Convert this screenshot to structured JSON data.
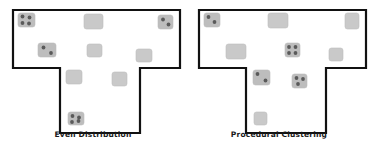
{
  "figure": {
    "background_color": "#ffffff",
    "outline_color": "#111111",
    "outline_width": 2.2,
    "room_fill_empty": "#c9c9c9",
    "room_fill_occupied": "#bdbdbd",
    "room_stroke": "#bdbdbd",
    "dot_color": "#5a5a5a",
    "dot_radius": 1.9,
    "room_corner_radius": 2.5
  },
  "panels": [
    {
      "id": "even-distribution",
      "caption": "Even Distribution",
      "outline_points": "13,10 180,10 180,68 140,68 140,133 60,133 60,68 13,68",
      "rooms": [
        {
          "name": "room-top-left",
          "x": 18,
          "y": 13,
          "w": 17,
          "h": 14,
          "occupied": true,
          "dots": [
            [
              22.5,
              16.5
            ],
            [
              29.5,
              17.5
            ],
            [
              22.5,
              23.0
            ],
            [
              29.0,
              23.5
            ]
          ]
        },
        {
          "name": "room-top-center",
          "x": 84,
          "y": 14,
          "w": 19,
          "h": 15,
          "occupied": false,
          "dots": []
        },
        {
          "name": "room-top-right",
          "x": 158,
          "y": 15,
          "w": 15,
          "h": 14,
          "occupied": true,
          "dots": [
            [
              163.0,
              19.5
            ],
            [
              168.5,
              24.5
            ]
          ]
        },
        {
          "name": "room-mid-left",
          "x": 38,
          "y": 43,
          "w": 18,
          "h": 14,
          "occupied": true,
          "dots": [
            [
              43.5,
              47.5
            ],
            [
              51.0,
              53.0
            ]
          ]
        },
        {
          "name": "room-mid-center",
          "x": 87,
          "y": 44,
          "w": 15,
          "h": 13,
          "occupied": false,
          "dots": []
        },
        {
          "name": "room-mid-right",
          "x": 136,
          "y": 49,
          "w": 16,
          "h": 13,
          "occupied": false,
          "dots": []
        },
        {
          "name": "room-stem-left",
          "x": 66,
          "y": 70,
          "w": 16,
          "h": 14,
          "occupied": false,
          "dots": []
        },
        {
          "name": "room-stem-right",
          "x": 112,
          "y": 72,
          "w": 15,
          "h": 14,
          "occupied": false,
          "dots": []
        },
        {
          "name": "room-stem-bottom",
          "x": 68,
          "y": 112,
          "w": 16,
          "h": 13,
          "occupied": true,
          "dots": [
            [
              72.5,
              116.0
            ],
            [
              79.0,
              117.5
            ],
            [
              72.0,
              122.0
            ],
            [
              78.5,
              121.0
            ]
          ]
        }
      ]
    },
    {
      "id": "procedural-clustering",
      "caption": "Procedural Clustering",
      "outline_points": "13,10 180,10 180,68 140,68 140,133 60,133 60,68 13,68",
      "rooms": [
        {
          "name": "room-top-left",
          "x": 18,
          "y": 13,
          "w": 16,
          "h": 14,
          "occupied": true,
          "dots": [
            [
              22.5,
              17.0
            ],
            [
              28.5,
              22.0
            ]
          ]
        },
        {
          "name": "room-top-center",
          "x": 82,
          "y": 13,
          "w": 20,
          "h": 15,
          "occupied": false,
          "dots": []
        },
        {
          "name": "room-top-right",
          "x": 159,
          "y": 13,
          "w": 14,
          "h": 16,
          "occupied": false,
          "dots": []
        },
        {
          "name": "room-mid-left",
          "x": 40,
          "y": 44,
          "w": 20,
          "h": 15,
          "occupied": false,
          "dots": []
        },
        {
          "name": "room-mid-center",
          "x": 99,
          "y": 43,
          "w": 15,
          "h": 14,
          "occupied": true,
          "dots": [
            [
              103.0,
              47.0
            ],
            [
              109.5,
              47.0
            ],
            [
              103.0,
              53.0
            ],
            [
              109.5,
              53.0
            ]
          ]
        },
        {
          "name": "room-mid-right",
          "x": 143,
          "y": 48,
          "w": 14,
          "h": 13,
          "occupied": false,
          "dots": []
        },
        {
          "name": "room-stem-left",
          "x": 67,
          "y": 70,
          "w": 17,
          "h": 15,
          "occupied": true,
          "dots": [
            [
              71.5,
              74.0
            ],
            [
              79.5,
              80.5
            ]
          ]
        },
        {
          "name": "room-stem-right",
          "x": 106,
          "y": 74,
          "w": 15,
          "h": 14,
          "occupied": true,
          "dots": [
            [
              110.5,
              78.0
            ],
            [
              117.0,
              79.0
            ],
            [
              112.0,
              84.0
            ]
          ]
        },
        {
          "name": "room-stem-bottom",
          "x": 68,
          "y": 112,
          "w": 13,
          "h": 13,
          "occupied": false,
          "dots": []
        }
      ]
    }
  ]
}
